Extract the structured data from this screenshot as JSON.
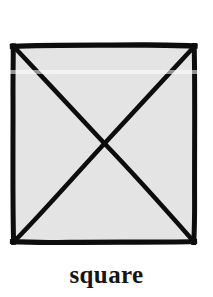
{
  "document": {
    "background_color": "#ffffff",
    "width": 213,
    "height": 297
  },
  "figure": {
    "name": "square-with-diagonals",
    "shape_label": "square",
    "stroke_color": "#0d0d0d",
    "fill_color": "#e4e4e4",
    "stroke_width_border": 5,
    "stroke_width_diagonal": 4,
    "style": "hand-drawn ink",
    "bounds": {
      "left": 13,
      "top": 46,
      "right": 195,
      "bottom": 242,
      "width": 182,
      "height": 196
    },
    "center": {
      "x": 104,
      "y": 144
    },
    "elements": [
      {
        "id": "outer-border",
        "type": "rectangle"
      },
      {
        "id": "diagonal-tl-br",
        "type": "line"
      },
      {
        "id": "diagonal-tr-bl",
        "type": "line"
      }
    ]
  },
  "caption": {
    "text": "square",
    "color": "#141414",
    "font_size_px": 25,
    "align": "center"
  }
}
